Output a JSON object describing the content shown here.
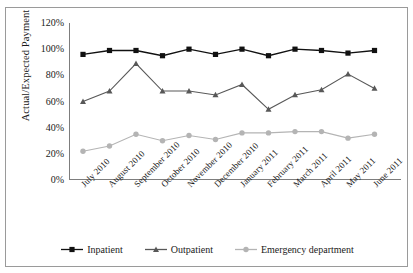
{
  "figure": {
    "top_caption": "",
    "border_color": "#9a9a9a",
    "background": "#ffffff"
  },
  "chart_data": {
    "type": "line",
    "title": "",
    "xlabel": "",
    "ylabel": "Actual/Expected Payment",
    "categories": [
      "July 2010",
      "August 2010",
      "September 2010",
      "October 2010",
      "November 2010",
      "December 2010",
      "January 2011",
      "February 2011",
      "March 2011",
      "April 2011",
      "May 2011",
      "June 2011"
    ],
    "ylim": [
      0,
      120
    ],
    "ytick_values": [
      0,
      20,
      40,
      60,
      80,
      100,
      120
    ],
    "ytick_labels": [
      "0%",
      "20%",
      "40%",
      "60%",
      "80%",
      "100%",
      "120%"
    ],
    "grid": false,
    "legend_position": "bottom",
    "xtick_rotation": -45,
    "series": [
      {
        "name": "Inpatient",
        "color": "#111111",
        "marker": "square",
        "values": [
          96,
          99,
          99,
          95,
          100,
          96,
          100,
          95,
          100,
          99,
          97,
          99
        ]
      },
      {
        "name": "Outpatient",
        "color": "#585858",
        "marker": "triangle",
        "values": [
          60,
          68,
          89,
          68,
          68,
          65,
          73,
          54,
          65,
          69,
          81,
          70
        ]
      },
      {
        "name": "Emergency department",
        "color": "#b4b4b4",
        "marker": "circle",
        "values": [
          22,
          26,
          35,
          30,
          34,
          31,
          36,
          36,
          37,
          37,
          32,
          35
        ]
      }
    ]
  }
}
